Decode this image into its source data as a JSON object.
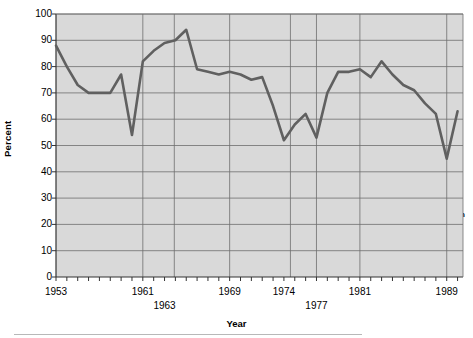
{
  "chart_data": {
    "type": "line",
    "title": "",
    "xlabel": "Year",
    "ylabel": "Percent",
    "ylim": [
      0,
      100
    ],
    "xlim": [
      1953,
      1990.5
    ],
    "ytick_values": [
      0,
      10,
      20,
      30,
      40,
      50,
      60,
      70,
      80,
      90,
      100
    ],
    "xtick_values": [
      1953,
      1961,
      1963,
      1969,
      1974,
      1977,
      1981,
      1989
    ],
    "xtick_labels": [
      "1953",
      "1961",
      "1963",
      "1969",
      "1974",
      "1977",
      "1981",
      "1989"
    ],
    "xtick_offset_row": [
      0,
      0,
      1,
      0,
      0,
      1,
      0,
      0
    ],
    "grid": true,
    "legend": "none",
    "line_color": "#606060",
    "plot_bg": "#d9d9d9",
    "series": [
      {
        "name": "Approval",
        "x": [
          1953,
          1954,
          1955,
          1956,
          1957,
          1958,
          1959,
          1960,
          1961,
          1962,
          1963,
          1964,
          1965,
          1966,
          1967,
          1968,
          1969,
          1970,
          1971,
          1972,
          1973,
          1974,
          1975,
          1976,
          1977,
          1978,
          1979,
          1980,
          1981,
          1982,
          1983,
          1984,
          1985,
          1986,
          1987,
          1988,
          1989,
          1990
        ],
        "values": [
          88,
          80,
          73,
          70,
          70,
          70,
          77,
          54,
          82,
          86,
          89,
          90,
          94,
          79,
          78,
          77,
          78,
          77,
          75,
          76,
          65,
          52,
          58,
          62,
          53,
          70,
          78,
          78,
          79,
          76,
          82,
          77,
          73,
          71,
          66,
          62,
          45,
          63
        ]
      }
    ],
    "presidents": [
      {
        "name": "Eisenhower",
        "start": 1953,
        "end": 1961
      },
      {
        "name": "Kennedy",
        "start": 1961,
        "end": 1963.9
      },
      {
        "name": "Johnson",
        "start": 1963.9,
        "end": 1969
      },
      {
        "name": "Nixon",
        "start": 1969,
        "end": 1974.6
      },
      {
        "name": "Ford",
        "start": 1974.6,
        "end": 1977
      },
      {
        "name": "Carter",
        "start": 1977,
        "end": 1981
      },
      {
        "name": "Reagan",
        "start": 1981,
        "end": 1989
      },
      {
        "name": "Bush",
        "start": 1989,
        "end": 1990.5
      }
    ],
    "president_divider_years": [
      1961,
      1963.9,
      1969,
      1974.6,
      1977,
      1981,
      1989
    ],
    "president_label_y_percent": 24
  }
}
